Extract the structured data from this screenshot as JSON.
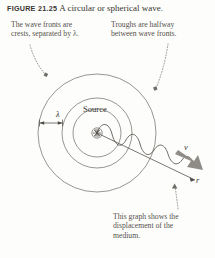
{
  "figure": {
    "tag": "FIGURE 21.25",
    "caption": "A circular or spherical wave."
  },
  "callouts": {
    "wavefronts": {
      "line1": "The wave fronts are",
      "line2": "crests, separated by λ."
    },
    "troughs": {
      "line1": "Troughs are halfway",
      "line2": "between wave fronts."
    },
    "graph": {
      "line1": "This graph shows the",
      "line2": "displacement of the",
      "line3": "medium."
    }
  },
  "diagram": {
    "source_label": "Source",
    "wavelength_label": "λ",
    "velocity_label": "v",
    "radial_axis_label": "r"
  },
  "colors": {
    "stroke": "#6b6862",
    "wave_stroke": "#55524c",
    "velocity_arrow": "#8f8c87",
    "leader": "#8a8782",
    "text": "#3b3833",
    "background": "#fdfdfc"
  }
}
